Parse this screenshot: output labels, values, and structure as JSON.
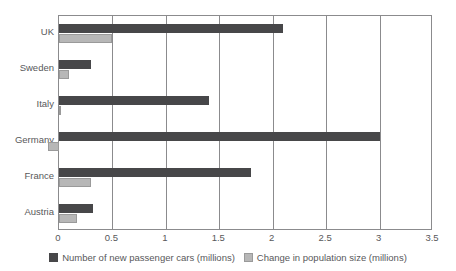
{
  "chart_data": {
    "type": "bar",
    "orientation": "horizontal",
    "title": "",
    "xlabel": "",
    "ylabel": "",
    "xlim": [
      0,
      3.5
    ],
    "xticks": [
      "0",
      "0.5",
      "1",
      "1.5",
      "2",
      "2.5",
      "3",
      "3.5"
    ],
    "xtick_values": [
      0,
      0.5,
      1,
      1.5,
      2,
      2.5,
      3,
      3.5
    ],
    "grid": "vertical",
    "legend_position": "bottom",
    "categories": [
      "UK",
      "Sweden",
      "Italy",
      "Germany",
      "France",
      "Austria"
    ],
    "series": [
      {
        "name": "Number of new passenger cars (millions)",
        "color": "#474749",
        "values": [
          2.1,
          0.3,
          1.4,
          3.0,
          1.8,
          0.32
        ]
      },
      {
        "name": "Change in population size (millions)",
        "color": "#b7b7b7",
        "values": [
          0.5,
          0.09,
          0.01,
          -0.1,
          0.3,
          0.17
        ]
      }
    ]
  },
  "legend": {
    "items": [
      {
        "label": "Number of new passenger cars (millions)",
        "swatch": "dark-grey-swatch"
      },
      {
        "label": "Change in population size (millions)",
        "swatch": "light-grey-swatch"
      }
    ]
  }
}
